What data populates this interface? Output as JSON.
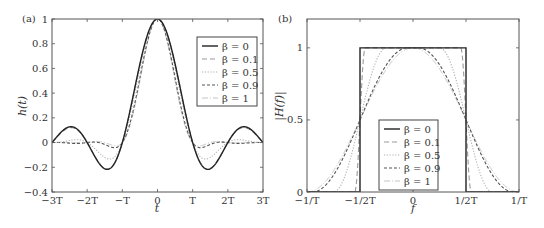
{
  "chart_data": [
    {
      "type": "line",
      "panel_label": "(a)",
      "title": "",
      "xlabel": "t",
      "ylabel": "h(t)",
      "xlim": [
        -3,
        3
      ],
      "ylim": [
        -0.4,
        1
      ],
      "x_unit": "T",
      "xticks": [
        -3,
        -2,
        -1,
        0,
        1,
        2,
        3
      ],
      "xtick_labels": [
        "−3T",
        "−2T",
        "−T",
        "0",
        "T",
        "2T",
        "3T"
      ],
      "yticks": [
        -0.4,
        -0.2,
        0,
        0.2,
        0.4,
        0.6,
        0.8,
        1
      ],
      "ytick_labels": [
        "−0.4",
        "−0.2",
        "0",
        "0.2",
        "0.4",
        "0.6",
        "0.8",
        "1"
      ],
      "grid": false,
      "legend_position": "upper right",
      "description": "Raised-cosine pulse impulse response h(t) = sinc(t/T)·cos(πβt/T)/(1−(2βt/T)²)",
      "series": [
        {
          "name": "β = 0",
          "beta": 0,
          "style": "solid",
          "color": "#222222"
        },
        {
          "name": "β = 0.1",
          "beta": 0.1,
          "style": "dashed-long",
          "color": "#9a9a9a"
        },
        {
          "name": "β = 0.5",
          "beta": 0.5,
          "style": "dotted",
          "color": "#b0b0b0"
        },
        {
          "name": "β = 0.9",
          "beta": 0.9,
          "style": "dashed",
          "color": "#555555"
        },
        {
          "name": "β = 1",
          "beta": 1,
          "style": "dash-dot-light",
          "color": "#c4c4c4"
        }
      ],
      "key_values": {
        "peak": {
          "t": 0,
          "h": 1
        },
        "beta0_first_minimum": {
          "t": 1.43,
          "h": -0.217
        },
        "beta0_first_sidelobe": {
          "t": 2.46,
          "h": 0.128
        },
        "beta0.5_first_minimum": {
          "t": 1.4,
          "h": -0.13
        },
        "beta1_first_minimum": {
          "t": 1.25,
          "h": -0.04
        },
        "zero_crossings": [
          -3,
          -2,
          -1,
          1,
          2,
          3
        ]
      }
    },
    {
      "type": "line",
      "panel_label": "(b)",
      "title": "",
      "xlabel": "f",
      "ylabel": "|H(f)|",
      "xlim": [
        -1,
        1
      ],
      "ylim": [
        0,
        1.2
      ],
      "x_unit": "1/T",
      "xticks": [
        -1,
        -0.5,
        0,
        0.5,
        1
      ],
      "xtick_labels": [
        "−1/T",
        "−1/2T",
        "0",
        "1/2T",
        "1/T"
      ],
      "yticks": [
        0,
        0.5,
        1
      ],
      "ytick_labels": [
        "0",
        "0.5",
        "1"
      ],
      "grid": false,
      "legend_position": "lower center",
      "description": "Raised-cosine spectrum: flat to (1−β)/2T, cosine roll-off to (1+β)/2T, value 0.5 at f = ±1/2T",
      "series": [
        {
          "name": "β = 0",
          "beta": 0,
          "style": "solid",
          "color": "#222222"
        },
        {
          "name": "β = 0.1",
          "beta": 0.1,
          "style": "dashed-long",
          "color": "#9a9a9a"
        },
        {
          "name": "β = 0.5",
          "beta": 0.5,
          "style": "dotted",
          "color": "#b0b0b0"
        },
        {
          "name": "β = 0.9",
          "beta": 0.9,
          "style": "dashed",
          "color": "#555555"
        },
        {
          "name": "β = 1",
          "beta": 1,
          "style": "dash-dot-light",
          "color": "#c4c4c4"
        }
      ],
      "key_values": {
        "passband_value": 1,
        "crossover": {
          "f": 0.5,
          "H": 0.5
        },
        "beta1_band_edge": 1,
        "beta0_band_edge": 0.5
      }
    }
  ]
}
